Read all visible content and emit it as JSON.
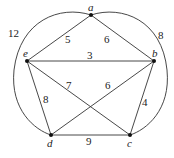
{
  "graph": {
    "nodes": [
      {
        "id": "a",
        "label": "a",
        "x": 91,
        "y": 15,
        "lx": 88,
        "ly": 11
      },
      {
        "id": "b",
        "label": "b",
        "x": 154,
        "y": 61,
        "lx": 152,
        "ly": 57
      },
      {
        "id": "c",
        "label": "c",
        "x": 130,
        "y": 135,
        "lx": 127,
        "ly": 147
      },
      {
        "id": "d",
        "label": "d",
        "x": 51,
        "y": 135,
        "lx": 47,
        "ly": 147
      },
      {
        "id": "e",
        "label": "e",
        "x": 27,
        "y": 61,
        "lx": 23,
        "ly": 57
      }
    ],
    "edges": [
      {
        "from": "a",
        "to": "e",
        "weight": "5",
        "lx": 65,
        "ly": 43
      },
      {
        "from": "a",
        "to": "b",
        "weight": "6",
        "lx": 104,
        "ly": 43
      },
      {
        "from": "e",
        "to": "b",
        "weight": "3",
        "lx": 87,
        "ly": 59
      },
      {
        "from": "e",
        "to": "c",
        "weight": "7",
        "lx": 66,
        "ly": 89
      },
      {
        "from": "b",
        "to": "d",
        "weight": "6",
        "lx": 105,
        "ly": 89
      },
      {
        "from": "e",
        "to": "d",
        "weight": "8",
        "lx": 43,
        "ly": 103
      },
      {
        "from": "b",
        "to": "c",
        "weight": "4",
        "lx": 142,
        "ly": 106
      },
      {
        "from": "d",
        "to": "c",
        "weight": "9",
        "lx": 86,
        "ly": 145
      },
      {
        "from": "a",
        "to": "d",
        "weight": "12",
        "curved": "left",
        "lx": 8,
        "ly": 37
      },
      {
        "from": "a",
        "to": "c",
        "weight": "8",
        "curved": "right",
        "lx": 158,
        "ly": 39
      }
    ]
  },
  "colors": {
    "line": "#333333",
    "node": "#111111"
  }
}
